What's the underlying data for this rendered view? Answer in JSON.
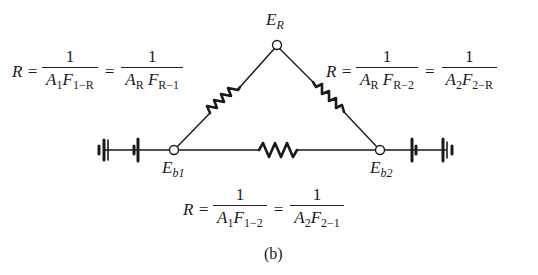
{
  "figure": {
    "caption": "(b)",
    "nodes": {
      "reradiating": {
        "symbol": "E",
        "subscript": "R"
      },
      "surface1": {
        "symbol": "E",
        "subscript": "b1"
      },
      "surface2": {
        "symbol": "E",
        "subscript": "b2"
      }
    },
    "equations": {
      "left": {
        "lhs": "R =",
        "eq_sign": "=",
        "frac1": {
          "num": "1",
          "den_A": "A",
          "den_A_sub": "1",
          "den_F": "F",
          "den_F_sub": "1−R"
        },
        "frac2": {
          "num": "1",
          "den_A": "A",
          "den_A_sub": "R",
          "den_F": "F",
          "den_F_sub": "R−1"
        }
      },
      "right": {
        "lhs": "R =",
        "eq_sign": "=",
        "frac1": {
          "num": "1",
          "den_A": "A",
          "den_A_sub": "R",
          "den_F": "F",
          "den_F_sub": "R−2"
        },
        "frac2": {
          "num": "1",
          "den_A": "A",
          "den_A_sub": "2",
          "den_F": "F",
          "den_F_sub": "2−R"
        }
      },
      "bottom": {
        "lhs": "R =",
        "eq_sign": "=",
        "frac1": {
          "num": "1",
          "den_A": "A",
          "den_A_sub": "1",
          "den_F": "F",
          "den_F_sub": "1−2"
        },
        "frac2": {
          "num": "1",
          "den_A": "A",
          "den_A_sub": "2",
          "den_F": "F",
          "den_F_sub": "2−1"
        }
      }
    },
    "components": {
      "resistors": [
        "R_1-R",
        "R_R-2",
        "R_1-2"
      ],
      "batteries_left": 2,
      "batteries_right": 2
    },
    "colors": {
      "ink": "#1a1a1a",
      "background": "#ffffff"
    }
  }
}
